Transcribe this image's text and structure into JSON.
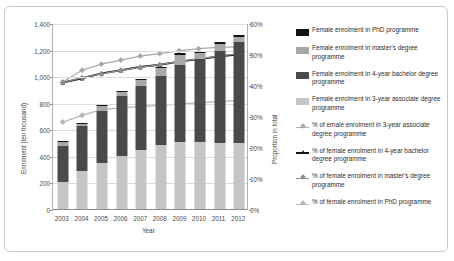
{
  "chart_data": {
    "type": "bar",
    "title": "",
    "xlabel": "Year",
    "ylabel": "Enrolment (ten thousand)",
    "y2label": "Proportion in total",
    "categories": [
      "2003",
      "2004",
      "2005",
      "2006",
      "2007",
      "2008",
      "2009",
      "2010",
      "2011",
      "2012"
    ],
    "ylim": [
      0,
      1400
    ],
    "ytick_labels": [
      "0",
      "200",
      "400",
      "600",
      "800",
      "1,000",
      "1,200",
      "1,400"
    ],
    "ytick_values": [
      0,
      200,
      400,
      600,
      800,
      1000,
      1200,
      1400
    ],
    "y2lim": [
      0,
      60
    ],
    "y2tick_labels": [
      "0%",
      "10%",
      "20%",
      "30%",
      "40%",
      "50%",
      "60%"
    ],
    "y2tick_values": [
      0,
      10,
      20,
      30,
      40,
      50,
      60
    ],
    "grid": true,
    "legend_position": "right",
    "stacked_series": [
      {
        "name": "Female enrolment in 3-year associate degree programme",
        "axis": "left",
        "color": "#c5c5c5",
        "values": [
          205,
          283,
          350,
          400,
          443,
          480,
          503,
          508,
          500,
          497
        ]
      },
      {
        "name": "Female enrolment in 4-year bachelor degree programme",
        "axis": "left",
        "color": "#4a4a4a",
        "values": [
          272,
          339,
          390,
          452,
          480,
          524,
          583,
          623,
          693,
          760
        ]
      },
      {
        "name": "Female enrolment in master's degree programme",
        "axis": "left",
        "color": "#a8a8a8",
        "values": [
          25,
          20,
          32,
          31,
          50,
          55,
          74,
          42,
          49,
          36
        ]
      },
      {
        "name": "Female enrolment in PhD programme",
        "axis": "left",
        "color": "#141414",
        "values": [
          8,
          7,
          8,
          8,
          9,
          10,
          12,
          12,
          14,
          16
        ]
      }
    ],
    "line_series": [
      {
        "name": "% of emale enrolment in 3-year associate degree programme",
        "axis": "right",
        "color": "#a8a8a8",
        "marker": "diamond",
        "values": [
          41.2,
          45.0,
          47.0,
          48.3,
          49.6,
          50.4,
          51.3,
          52.0,
          52.4,
          52.6
        ]
      },
      {
        "name": "% of female enrolment in 4-year bachelor degree programme",
        "axis": "right",
        "color": "#141414",
        "marker": "triangle",
        "values": [
          41.0,
          42.4,
          44.0,
          45.0,
          46.1,
          46.8,
          47.8,
          48.6,
          49.4,
          50.1
        ]
      },
      {
        "name": "% of female enrolment in master's degree programme",
        "axis": "right",
        "color": "#8f8f8f",
        "marker": "diamond",
        "values": [
          41.0,
          42.6,
          43.8,
          45.0,
          45.9,
          46.8,
          47.9,
          48.7,
          49.6,
          50.3
        ]
      },
      {
        "name": "% of female enrolment in PhD programme",
        "axis": "right",
        "color": "#b5b5b5",
        "marker": "diamond",
        "values": [
          28.2,
          30.4,
          32.2,
          32.8,
          33.2,
          33.6,
          34.0,
          34.4,
          34.8,
          35.2
        ]
      }
    ],
    "bar_totals": [
      510,
      649,
      780,
      891,
      982,
      1069,
      1172,
      1185,
      1256,
      1309
    ]
  },
  "legend": {
    "items": [
      {
        "label": "Female enrolment in PhD programme",
        "key": "swatch",
        "color": "#141414"
      },
      {
        "label": "Female enrolment in master's degree programme",
        "key": "swatch",
        "color": "#a8a8a8"
      },
      {
        "label": "Female enrolment in 4-year bachelor degree programme",
        "key": "swatch",
        "color": "#4a4a4a"
      },
      {
        "label": "Female enrolment in 3-year associate degree programme",
        "key": "swatch",
        "color": "#c5c5c5"
      },
      {
        "label": "% of emale enrolment in 3-year associate degree programme",
        "key": "line-diamond",
        "color": "#a8a8a8"
      },
      {
        "label": "% of female enrolment in 4-year bachelor degree programme",
        "key": "line-triangle",
        "color": "#141414"
      },
      {
        "label": "% of female enrolment in master's degree programme",
        "key": "line-diamond",
        "color": "#8f8f8f"
      },
      {
        "label": "% of female enrolment in PhD programme",
        "key": "line-diamond",
        "color": "#b5b5b5"
      }
    ]
  }
}
